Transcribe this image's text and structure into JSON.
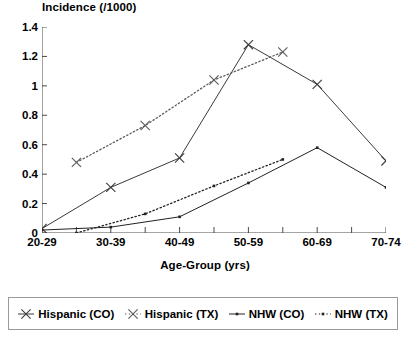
{
  "chart_data": {
    "type": "line",
    "title": "",
    "ylabel": "Incidence  (/1000)",
    "xlabel": "Age-Group  (yrs)",
    "categories": [
      "20-29",
      "30-39",
      "40-49",
      "50-59",
      "60-69",
      "70-74"
    ],
    "ylim": [
      0,
      1.4
    ],
    "ytick_labels": [
      "0",
      "0.2",
      "0.4",
      "0.6",
      "0.8",
      "1",
      "1.2",
      "1.4"
    ],
    "ytick_values": [
      0,
      0.2,
      0.4,
      0.6,
      0.8,
      1,
      1.2,
      1.4
    ],
    "grid": false,
    "legend_position": "bottom",
    "series": [
      {
        "name": "Hispanic (CO)",
        "marker": "x",
        "line": "solid",
        "color": "#3a3a3a",
        "x": [
          0,
          1,
          2,
          3,
          4,
          5
        ],
        "values": [
          0.03,
          0.31,
          0.51,
          1.28,
          1.01,
          0.49
        ]
      },
      {
        "name": "Hispanic (TX)",
        "marker": "x",
        "line": "dotted",
        "color": "#5a5a5a",
        "x": [
          0.5,
          1.5,
          2.5,
          3.5
        ],
        "values": [
          0.48,
          0.73,
          1.04,
          1.23
        ]
      },
      {
        "name": "NHW (CO)",
        "marker": "square",
        "line": "solid",
        "color": "#222222",
        "x": [
          0,
          1,
          2,
          3,
          4,
          5
        ],
        "values": [
          0.02,
          0.04,
          0.11,
          0.34,
          0.58,
          0.31
        ]
      },
      {
        "name": "NHW (TX)",
        "marker": "square",
        "line": "dotted",
        "color": "#222222",
        "x": [
          0.5,
          1.5,
          2.5,
          3.5
        ],
        "values": [
          0.0,
          0.13,
          0.32,
          0.5
        ]
      }
    ]
  },
  "legend": {
    "items": [
      {
        "label": "Hispanic (CO)"
      },
      {
        "label": "Hispanic (TX)"
      },
      {
        "label": "NHW (CO)"
      },
      {
        "label": "NHW (TX)"
      }
    ]
  }
}
